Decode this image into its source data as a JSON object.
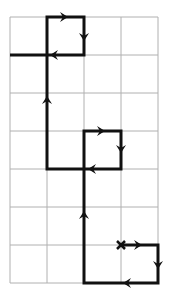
{
  "diagram": {
    "type": "grid-path",
    "grid": {
      "columns": 4,
      "rows": 7,
      "x_lines": [
        10,
        47,
        84,
        121,
        158
      ],
      "y_lines": [
        17,
        55,
        93,
        131,
        169,
        207,
        245,
        283
      ],
      "line_color": "#b0b0b0"
    },
    "path": {
      "color": "#111111",
      "start_marker": "x",
      "start": [
        121,
        245
      ],
      "points": [
        [
          121,
          245
        ],
        [
          158,
          245
        ],
        [
          158,
          283
        ],
        [
          84,
          283
        ],
        [
          84,
          131
        ],
        [
          121,
          131
        ],
        [
          121,
          169
        ],
        [
          47,
          169
        ],
        [
          47,
          17
        ],
        [
          84,
          17
        ],
        [
          84,
          55
        ],
        [
          10,
          55
        ]
      ],
      "arrows": [
        {
          "at": [
            141,
            245
          ],
          "dir": "right"
        },
        {
          "at": [
            158,
            268
          ],
          "dir": "down"
        },
        {
          "at": [
            124,
            283
          ],
          "dir": "left"
        },
        {
          "at": [
            84,
            212
          ],
          "dir": "up"
        },
        {
          "at": [
            104,
            131
          ],
          "dir": "right"
        },
        {
          "at": [
            121,
            152
          ],
          "dir": "down"
        },
        {
          "at": [
            89,
            169
          ],
          "dir": "left"
        },
        {
          "at": [
            47,
            97
          ],
          "dir": "up"
        },
        {
          "at": [
            67,
            17
          ],
          "dir": "right"
        },
        {
          "at": [
            84,
            40
          ],
          "dir": "down"
        },
        {
          "at": [
            51,
            55
          ],
          "dir": "left"
        }
      ]
    }
  }
}
